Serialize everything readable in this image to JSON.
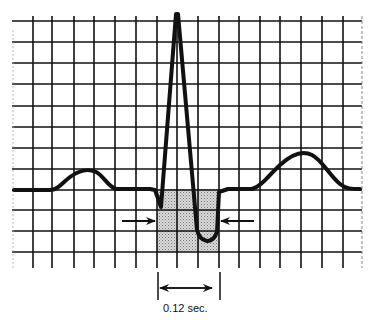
{
  "diagram": {
    "type": "ecg-strip",
    "waves": [
      "P wave",
      "QRS complex",
      "T wave"
    ],
    "annotation": {
      "measurement_label": "0.12 sec.",
      "marker": "double-headed arrow spanning QRS width",
      "side_arrows": "two arrows pointing at shaded QRS region"
    },
    "grid": {
      "columns": 17,
      "rows": 11,
      "line_color": "#111111",
      "background": "#ffffff"
    },
    "shaded_region": {
      "color": "#c8c8c8",
      "pattern": "stipple",
      "span_boxes": 3
    }
  }
}
